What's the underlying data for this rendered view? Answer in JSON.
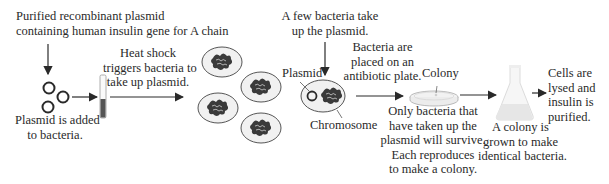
{
  "diagram": {
    "steps": [
      {
        "id": "plasmid-source",
        "lines": [
          "Purified recombinant plasmid",
          "containing human insulin gene for A chain"
        ]
      },
      {
        "id": "plasmid-added",
        "lines": [
          "Plasmid is added",
          "to bacteria."
        ]
      },
      {
        "id": "heat-shock",
        "lines": [
          "Heat shock",
          "triggers bacteria to",
          "take up plasmid."
        ]
      },
      {
        "id": "few-take-up",
        "lines": [
          "A few bacteria take",
          "up the plasmid."
        ]
      },
      {
        "id": "antibiotic-plate",
        "lines": [
          "Bacteria are",
          "placed on an",
          "antibiotic plate."
        ]
      },
      {
        "id": "selection",
        "lines": [
          "Only bacteria that",
          "have taken up the",
          "plasmid will survive.",
          "Each reproduces",
          "to make a colony."
        ]
      },
      {
        "id": "grow-colony",
        "lines": [
          "A colony is",
          "grown to make",
          "identical bacteria."
        ]
      },
      {
        "id": "purify",
        "lines": [
          "Cells are",
          "lysed and",
          "insulin is",
          "purified."
        ]
      }
    ],
    "callouts": {
      "plasmid": "Plasmid",
      "chromosome": "Chromosome",
      "colony": "Colony"
    },
    "icons": [
      "plasmid-rings-icon",
      "test-tube-icon",
      "bacteria-cell-icon",
      "transformed-bacterium-icon",
      "petri-dish-icon",
      "flask-icon",
      "arrow-icon"
    ],
    "colors": {
      "stroke": "#2a2a2a",
      "cell_fill": "#f1f1f1",
      "tube_liquid": "#555555",
      "glass": "#e8e8e8"
    }
  }
}
